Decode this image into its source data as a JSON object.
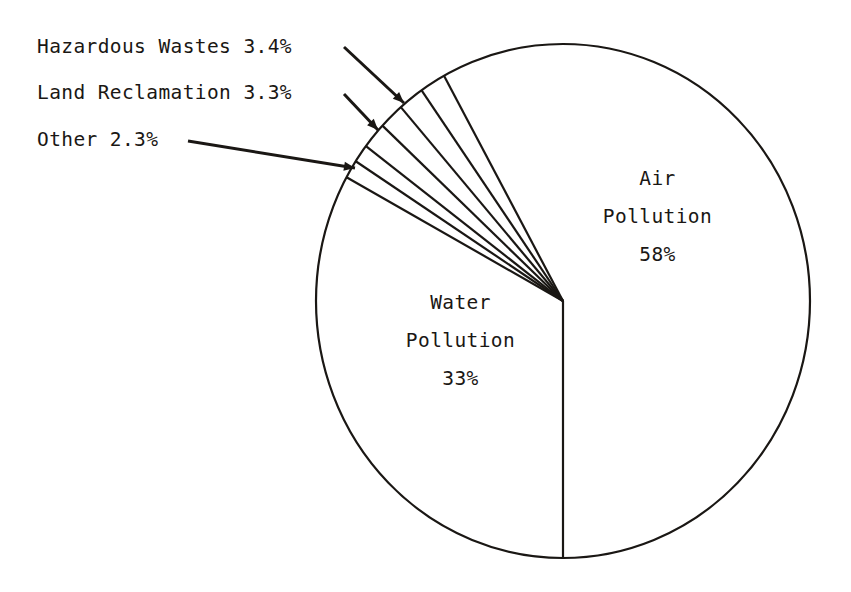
{
  "figure": {
    "background_color": "#ffffff",
    "ink_color": "#1a1714",
    "center": {
      "x": 563,
      "y": 301
    },
    "radius": 247
  },
  "chart_data": {
    "type": "pie",
    "title": "",
    "subtitle": "",
    "xlabel": "",
    "ylabel": "",
    "legend_position": "none",
    "grid": false,
    "total_percent": 100,
    "start_angle_deg": 180,
    "direction": "clockwise",
    "categories": [
      "Air Pollution",
      "Hazardous Wastes",
      "Land Reclamation",
      "Other",
      "Water Pollution"
    ],
    "values": [
      58,
      3.4,
      3.3,
      2.3,
      33
    ],
    "slices": [
      {
        "name": "Air Pollution",
        "label": "Air Pollution",
        "value": 58,
        "value_text": "58%",
        "label_line_1": "Air",
        "label_line_2": "Pollution",
        "label_line_3": "58%",
        "label_placement": "inside",
        "color": "#ffffff",
        "sweep_deg": 208.8
      },
      {
        "name": "Hazardous Wastes",
        "label": "Hazardous Wastes",
        "value": 3.4,
        "value_text": "3.4%",
        "callout_text": "Hazardous Wastes 3.4%",
        "label_placement": "callout-left",
        "color": "#ffffff",
        "sweep_deg": 12.24
      },
      {
        "name": "Land Reclamation",
        "label": "Land Reclamation",
        "value": 3.3,
        "value_text": "3.3%",
        "callout_text": "Land Reclamation 3.3%",
        "label_placement": "callout-left",
        "color": "#ffffff",
        "sweep_deg": 11.88
      },
      {
        "name": "Other",
        "label": "Other",
        "value": 2.3,
        "value_text": "2.3%",
        "callout_text": "Other 2.3%",
        "label_placement": "callout-left",
        "color": "#ffffff",
        "sweep_deg": 8.28
      },
      {
        "name": "Water Pollution",
        "label": "Water Pollution",
        "value": 33,
        "value_text": "33%",
        "label_line_1": "Water",
        "label_line_2": "Pollution",
        "label_line_3": "33%",
        "label_placement": "inside",
        "color": "#ffffff",
        "sweep_deg": 118.8
      }
    ]
  },
  "callouts": {
    "hazardous": {
      "text": "Hazardous Wastes 3.4%"
    },
    "land": {
      "text": "Land Reclamation 3.3%"
    },
    "other": {
      "text": "Other 2.3%"
    }
  },
  "inside_labels": {
    "air": {
      "line1": "Air",
      "line2": "Pollution",
      "line3": "58%"
    },
    "water": {
      "line1": "Water",
      "line2": "Pollution",
      "line3": "33%"
    }
  }
}
